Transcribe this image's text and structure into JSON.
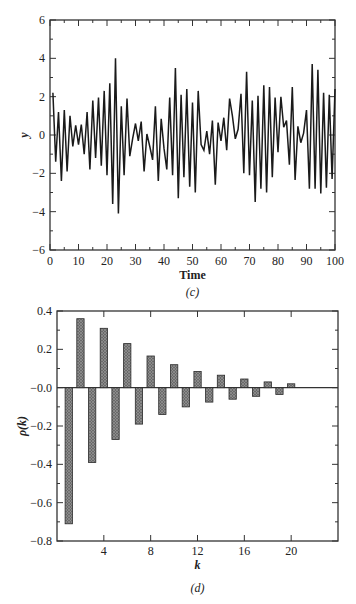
{
  "chart_data": [
    {
      "type": "line",
      "panel": "(c)",
      "title": "",
      "xlabel": "Time",
      "ylabel": "y",
      "xlim": [
        0,
        100
      ],
      "ylim": [
        -6,
        6
      ],
      "xticks": [
        0,
        10,
        20,
        30,
        40,
        50,
        60,
        70,
        80,
        90,
        100
      ],
      "yticks": [
        -6,
        -4,
        -2,
        0,
        2,
        4,
        6
      ],
      "grid": false,
      "x": [
        1,
        2,
        3,
        4,
        5,
        6,
        7,
        8,
        9,
        10,
        11,
        12,
        13,
        14,
        15,
        16,
        17,
        18,
        19,
        20,
        21,
        22,
        23,
        24,
        25,
        26,
        27,
        28,
        29,
        30,
        31,
        32,
        33,
        34,
        35,
        36,
        37,
        38,
        39,
        40,
        41,
        42,
        43,
        44,
        45,
        46,
        47,
        48,
        49,
        50,
        51,
        52,
        53,
        54,
        55,
        56,
        57,
        58,
        59,
        60,
        61,
        62,
        63,
        64,
        65,
        66,
        67,
        68,
        69,
        70,
        71,
        72,
        73,
        74,
        75,
        76,
        77,
        78,
        79,
        80,
        81,
        82,
        83,
        84,
        85,
        86,
        87,
        88,
        89,
        90,
        91,
        92,
        93,
        94,
        95,
        96,
        97,
        98,
        99,
        100
      ],
      "y": [
        2.2,
        -1.4,
        1.2,
        -2.4,
        1.3,
        -1.9,
        1.0,
        -0.6,
        0.5,
        -0.5,
        0.55,
        -1.0,
        1.2,
        -1.8,
        1.8,
        -1.2,
        1.95,
        -1.6,
        2.3,
        -2.1,
        2.7,
        -3.6,
        4.0,
        -4.1,
        1.5,
        -2.1,
        1.9,
        -1.1,
        -0.2,
        0.6,
        -0.3,
        0.7,
        -1.9,
        0.05,
        -0.6,
        -1.3,
        1.5,
        -2.4,
        0.85,
        -0.7,
        -1.8,
        1.95,
        -2.1,
        3.5,
        -3.3,
        2.1,
        -2.2,
        2.4,
        -2.7,
        1.7,
        -3.0,
        2.3,
        -0.5,
        -0.8,
        0.2,
        -1.0,
        0.75,
        -2.6,
        0.65,
        -0.3,
        0.9,
        -0.8,
        1.9,
        1.0,
        -0.2,
        0.3,
        2.15,
        -2.0,
        3.3,
        -2.1,
        1.8,
        -3.5,
        2.05,
        -2.8,
        2.6,
        -3.0,
        2.5,
        -2.2,
        1.95,
        -0.9,
        2.0,
        0.4,
        0.75,
        -1.55,
        2.5,
        -2.35,
        0.45,
        -0.4,
        0.1,
        1.3,
        -2.8,
        3.7,
        -2.8,
        3.4,
        -3.05,
        2.2,
        -2.75,
        2.1,
        -2.3,
        2.4
      ]
    },
    {
      "type": "bar",
      "panel": "(d)",
      "title": "",
      "xlabel": "k",
      "ylabel": "ρ(k)",
      "xlim": [
        0,
        24
      ],
      "ylim": [
        -0.8,
        0.4
      ],
      "xticks": [
        4,
        8,
        12,
        16,
        20
      ],
      "yticks": [
        -0.8,
        -0.6,
        -0.4,
        -0.2,
        0.0,
        0.2,
        0.4
      ],
      "grid": false,
      "categories": [
        1,
        2,
        3,
        4,
        5,
        6,
        7,
        8,
        9,
        10,
        11,
        12,
        13,
        14,
        15,
        16,
        17,
        18,
        19,
        20
      ],
      "values": [
        -0.71,
        0.36,
        -0.39,
        0.31,
        -0.27,
        0.23,
        -0.19,
        0.165,
        -0.14,
        0.12,
        -0.1,
        0.085,
        -0.075,
        0.065,
        -0.06,
        0.045,
        -0.045,
        0.03,
        -0.035,
        0.02
      ]
    }
  ],
  "panels": {
    "c": {
      "caption": "(c)",
      "xlabel": "Time",
      "ylabel": "y",
      "xtick_labels": [
        "0",
        "10",
        "20",
        "30",
        "40",
        "50",
        "60",
        "70",
        "80",
        "90",
        "100"
      ],
      "ytick_labels": [
        "6",
        "4",
        "2",
        "0",
        "−2",
        "−4",
        "−6"
      ]
    },
    "d": {
      "caption": "(d)",
      "xlabel": "k",
      "ylabel": "ρ(k)",
      "xtick_labels": [
        "4",
        "8",
        "12",
        "16",
        "20"
      ],
      "ytick_labels": [
        "0.4",
        "0.2",
        "−0.0",
        "−0.2",
        "−0.4",
        "−0.6",
        "−0.8"
      ]
    }
  },
  "colors": {
    "line": "#1a1a1a",
    "axis": "#333333",
    "bar_fill": "#6a6a6a",
    "bar_edge": "#2a2a2a"
  }
}
